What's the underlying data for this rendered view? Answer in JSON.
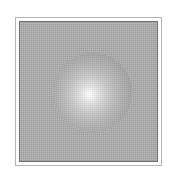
{
  "figure": {
    "canvas": {
      "width": 177,
      "height": 181,
      "background_color": "#ffffff"
    },
    "outer_frame": {
      "name": "outer rule",
      "x": 15,
      "y": 17,
      "width": 147,
      "height": 149,
      "border_color": "#b4b4b4",
      "border_width": 1,
      "fill_color": "#ffffff"
    },
    "inner_frame": {
      "name": "inner border",
      "x": 19,
      "y": 21,
      "width": 139,
      "height": 141,
      "border_color": "#6e6e6e",
      "border_width": 1
    },
    "panel": {
      "name": "halftone grey panel",
      "fill_color": "#a9a9a9",
      "texture": "halftone-dither"
    },
    "sphere": {
      "name": "shaded sphere",
      "center_x": 91,
      "center_y": 91,
      "diameter": 79,
      "highlight_x": 88,
      "highlight_y": 93,
      "highlight_color": "#fdfdfd",
      "rim_color": "#949494",
      "shading": "radial-gradient"
    }
  }
}
